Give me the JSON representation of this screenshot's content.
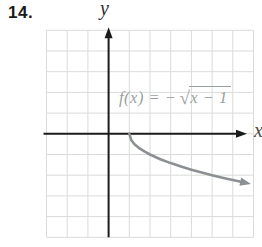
{
  "problem": {
    "number": "14."
  },
  "equation": {
    "prefix": "f(x) = −",
    "radical_sign": "√",
    "radicand": "x − 1",
    "full": "f(x) = −√(x − 1)"
  },
  "colors": {
    "axis": "#1c1c1c",
    "grid": "#d9dcd9",
    "curve": "#8d9092",
    "equation_text": "#9aa0a0",
    "problem_text": "#1a1a1a"
  },
  "chart_data": {
    "type": "line",
    "title": "",
    "equation_label": "f(x) = −√(x − 1)",
    "xlabel": "x",
    "ylabel": "y",
    "xlim": [
      -3,
      7
    ],
    "ylim": [
      -5,
      5
    ],
    "grid": true,
    "grid_unit": 1,
    "legend": false,
    "series": [
      {
        "name": "f(x) = -sqrt(x-1)",
        "color": "#8d9092",
        "start_point": [
          1,
          0
        ],
        "arrow_end": true,
        "points": [
          [
            1,
            0
          ],
          [
            1.1,
            -0.316
          ],
          [
            1.25,
            -0.5
          ],
          [
            1.5,
            -0.707
          ],
          [
            1.75,
            -0.866
          ],
          [
            2,
            -1
          ],
          [
            2.5,
            -1.225
          ],
          [
            3,
            -1.414
          ],
          [
            3.5,
            -1.581
          ],
          [
            4,
            -1.732
          ],
          [
            4.5,
            -1.871
          ],
          [
            5,
            -2
          ],
          [
            5.5,
            -2.121
          ],
          [
            6,
            -2.236
          ],
          [
            6.55,
            -2.356
          ]
        ]
      }
    ]
  }
}
